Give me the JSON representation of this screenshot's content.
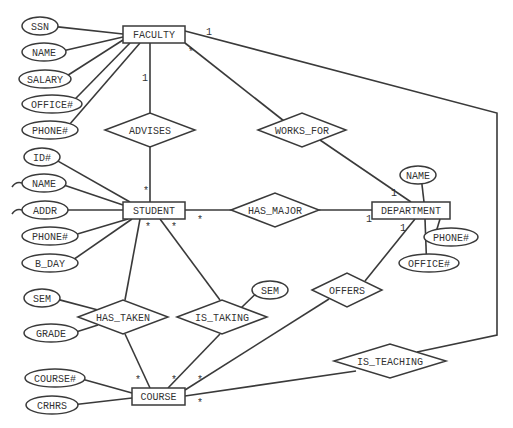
{
  "diagram": {
    "type": "entity-relationship",
    "colors": {
      "line": "#3a3a3a",
      "text": "#333333",
      "background": "#ffffff"
    },
    "entities": [
      {
        "id": "faculty",
        "label": "FACULTY",
        "x": 123,
        "y": 26,
        "w": 62,
        "h": 17
      },
      {
        "id": "student",
        "label": "STUDENT",
        "x": 123,
        "y": 202,
        "w": 62,
        "h": 17
      },
      {
        "id": "department",
        "label": "DEPARTMENT",
        "x": 372,
        "y": 202,
        "w": 78,
        "h": 17
      },
      {
        "id": "course",
        "label": "COURSE",
        "x": 132,
        "y": 388,
        "w": 53,
        "h": 17
      }
    ],
    "relationships": [
      {
        "id": "advises",
        "label": "ADVISES",
        "cx": 150,
        "cy": 130,
        "w": 90,
        "h": 34
      },
      {
        "id": "works_for",
        "label": "WORKS_FOR",
        "cx": 302,
        "cy": 130,
        "w": 88,
        "h": 34
      },
      {
        "id": "has_major",
        "label": "HAS_MAJOR",
        "cx": 275,
        "cy": 210,
        "w": 88,
        "h": 34
      },
      {
        "id": "offers",
        "label": "OFFERS",
        "cx": 347,
        "cy": 290,
        "w": 70,
        "h": 34
      },
      {
        "id": "has_taken",
        "label": "HAS_TAKEN",
        "cx": 123,
        "cy": 317,
        "w": 90,
        "h": 34
      },
      {
        "id": "is_taking",
        "label": "IS_TAKING",
        "cx": 222,
        "cy": 317,
        "w": 90,
        "h": 34
      },
      {
        "id": "is_teaching",
        "label": "IS_TEACHING",
        "cx": 390,
        "cy": 361,
        "w": 112,
        "h": 34
      }
    ],
    "attributes": [
      {
        "id": "faculty_ssn",
        "label": "SSN",
        "cx": 40,
        "cy": 26,
        "rx": 18,
        "ry": 9,
        "to": [
          123,
          34
        ]
      },
      {
        "id": "faculty_name",
        "label": "NAME",
        "cx": 44,
        "cy": 52,
        "rx": 22,
        "ry": 9,
        "to": [
          123,
          37
        ]
      },
      {
        "id": "faculty_salary",
        "label": "SALARY",
        "cx": 45,
        "cy": 79,
        "rx": 26,
        "ry": 9,
        "to": [
          123,
          40
        ]
      },
      {
        "id": "faculty_office",
        "label": "OFFICE#",
        "cx": 52,
        "cy": 104,
        "rx": 30,
        "ry": 9,
        "to": [
          130,
          43
        ]
      },
      {
        "id": "faculty_phone",
        "label": "PHONE#",
        "cx": 50,
        "cy": 130,
        "rx": 28,
        "ry": 9,
        "to": [
          140,
          43
        ]
      },
      {
        "id": "student_id",
        "label": "ID#",
        "cx": 42,
        "cy": 157,
        "rx": 18,
        "ry": 9,
        "to": [
          130,
          202
        ]
      },
      {
        "id": "student_name",
        "label": "NAME",
        "cx": 44,
        "cy": 183,
        "rx": 22,
        "ry": 9,
        "to": [
          123,
          205
        ],
        "clipped": true
      },
      {
        "id": "student_addr",
        "label": "ADDR",
        "cx": 45,
        "cy": 210,
        "rx": 23,
        "ry": 9,
        "to": [
          123,
          210
        ],
        "clipped": true
      },
      {
        "id": "student_phone",
        "label": "PHONE#",
        "cx": 50,
        "cy": 236,
        "rx": 28,
        "ry": 9,
        "to": [
          128,
          219
        ]
      },
      {
        "id": "student_bday",
        "label": "B_DAY",
        "cx": 50,
        "cy": 263,
        "rx": 28,
        "ry": 9,
        "to": [
          132,
          219
        ]
      },
      {
        "id": "dept_name",
        "label": "NAME",
        "cx": 418,
        "cy": 175,
        "rx": 18,
        "ry": 9,
        "to": [
          424,
          202
        ]
      },
      {
        "id": "dept_phone",
        "label": "PHONE#",
        "cx": 451,
        "cy": 237,
        "rx": 27,
        "ry": 9,
        "to": [
          440,
          219
        ]
      },
      {
        "id": "dept_office",
        "label": "OFFICE#",
        "cx": 429,
        "cy": 263,
        "rx": 30,
        "ry": 9,
        "to": [
          425,
          219
        ]
      },
      {
        "id": "has_taken_sem",
        "label": "SEM",
        "cx": 42,
        "cy": 298,
        "rx": 18,
        "ry": 9,
        "to": [
          98,
          310
        ]
      },
      {
        "id": "has_taken_grade",
        "label": "GRADE",
        "cx": 51,
        "cy": 333,
        "rx": 27,
        "ry": 9,
        "to": [
          98,
          325
        ]
      },
      {
        "id": "is_taking_sem",
        "label": "SEM",
        "cx": 270,
        "cy": 290,
        "rx": 18,
        "ry": 9,
        "to": [
          241,
          308
        ]
      },
      {
        "id": "course_num",
        "label": "COURSE#",
        "cx": 55,
        "cy": 378,
        "rx": 30,
        "ry": 9,
        "to": [
          132,
          393
        ]
      },
      {
        "id": "course_crhrs",
        "label": "CRHRS",
        "cx": 52,
        "cy": 405,
        "rx": 26,
        "ry": 9,
        "to": [
          132,
          398
        ]
      }
    ],
    "connections": [
      {
        "from": "faculty",
        "to": "advises",
        "points": [
          [
            150,
            43
          ],
          [
            150,
            113
          ]
        ],
        "cardinality": {
          "label": "1",
          "x": 142,
          "y": 81
        }
      },
      {
        "from": "advises",
        "to": "student",
        "points": [
          [
            150,
            147
          ],
          [
            150,
            202
          ]
        ],
        "cardinality": {
          "label": "*",
          "x": 143,
          "y": 194
        }
      },
      {
        "from": "faculty",
        "to": "works_for",
        "points": [
          [
            185,
            43
          ],
          [
            284,
            121
          ]
        ],
        "cardinality": {
          "label": "*",
          "x": 188,
          "y": 55
        }
      },
      {
        "from": "works_for",
        "to": "department",
        "points": [
          [
            320,
            140
          ],
          [
            411,
            202
          ]
        ],
        "cardinality": {
          "label": "1",
          "x": 391,
          "y": 196
        }
      },
      {
        "from": "student",
        "to": "has_major",
        "points": [
          [
            185,
            210
          ],
          [
            231,
            210
          ]
        ],
        "cardinality": {
          "label": "*",
          "x": 197,
          "y": 223
        }
      },
      {
        "from": "has_major",
        "to": "department",
        "points": [
          [
            319,
            210
          ],
          [
            372,
            210
          ]
        ],
        "cardinality": {
          "label": "1",
          "x": 366,
          "y": 222
        }
      },
      {
        "from": "department",
        "to": "offers",
        "points": [
          [
            415,
            219
          ],
          [
            365,
            281
          ]
        ],
        "cardinality": {
          "label": "1",
          "x": 400,
          "y": 231
        }
      },
      {
        "from": "offers",
        "to": "course",
        "points": [
          [
            329,
            299
          ],
          [
            185,
            390
          ]
        ],
        "cardinality": {
          "label": "*",
          "x": 197,
          "y": 383
        }
      },
      {
        "from": "student",
        "to": "has_taken",
        "points": [
          [
            140,
            219
          ],
          [
            125,
            300
          ]
        ],
        "cardinality": {
          "label": "*",
          "x": 145,
          "y": 230
        }
      },
      {
        "from": "has_taken",
        "to": "course",
        "points": [
          [
            125,
            334
          ],
          [
            150,
            388
          ]
        ],
        "cardinality": {
          "label": "*",
          "x": 135,
          "y": 383
        }
      },
      {
        "from": "student",
        "to": "is_taking",
        "points": [
          [
            160,
            219
          ],
          [
            220,
            300
          ]
        ],
        "cardinality": {
          "label": "*",
          "x": 171,
          "y": 230
        }
      },
      {
        "from": "is_taking",
        "to": "course",
        "points": [
          [
            220,
            334
          ],
          [
            168,
            388
          ]
        ],
        "cardinality": {
          "label": "*",
          "x": 171,
          "y": 383
        }
      },
      {
        "from": "faculty",
        "to": "is_teaching",
        "points": [
          [
            185,
            31
          ],
          [
            497,
            113
          ],
          [
            497,
            335
          ],
          [
            417,
            352
          ]
        ],
        "cardinality": {
          "label": "1",
          "x": 206,
          "y": 35
        }
      },
      {
        "from": "is_teaching",
        "to": "course",
        "points": [
          [
            356,
            371
          ],
          [
            185,
            396
          ]
        ],
        "cardinality": {
          "label": "*",
          "x": 197,
          "y": 406
        }
      }
    ]
  }
}
